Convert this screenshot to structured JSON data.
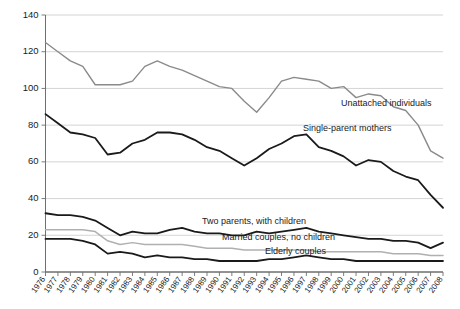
{
  "chart_data": {
    "type": "line",
    "title": "",
    "subtitle": "",
    "xlabel": "",
    "ylabel": "",
    "xlim": [
      1976,
      2008
    ],
    "ylim": [
      0,
      140
    ],
    "yticks": [
      0,
      20,
      40,
      60,
      80,
      100,
      120,
      140
    ],
    "grid": true,
    "legend_position": "inline-annotations",
    "categories": [
      1976,
      1977,
      1978,
      1979,
      1980,
      1981,
      1982,
      1983,
      1984,
      1985,
      1986,
      1987,
      1988,
      1989,
      1990,
      1991,
      1992,
      1993,
      1994,
      1995,
      1996,
      1997,
      1998,
      1999,
      2000,
      2001,
      2002,
      2003,
      2004,
      2005,
      2006,
      2007,
      2008
    ],
    "series": [
      {
        "name": "Unattached individuals",
        "color": "#8a8a8a",
        "width": 1.4,
        "label_x": 341,
        "label_y": 106,
        "values": [
          125,
          120,
          115,
          112,
          102,
          102,
          102,
          104,
          112,
          115,
          112,
          110,
          107,
          104,
          101,
          100,
          93,
          87,
          95,
          104,
          106,
          105,
          104,
          100,
          101,
          95,
          97,
          96,
          90,
          88,
          80,
          66,
          62
        ]
      },
      {
        "name": "Single-parent mothers",
        "color": "#1a1a1a",
        "width": 1.8,
        "label_x": 303,
        "label_y": 131,
        "values": [
          86,
          81,
          76,
          75,
          73,
          64,
          65,
          70,
          72,
          76,
          76,
          75,
          72,
          68,
          66,
          62,
          58,
          62,
          67,
          70,
          74,
          75,
          68,
          66,
          63,
          58,
          61,
          60,
          55,
          52,
          50,
          42,
          35
        ]
      },
      {
        "name": "Two parents, with children",
        "color": "#1a1a1a",
        "width": 1.8,
        "label_x": 202,
        "label_y": 224,
        "values": [
          32,
          31,
          31,
          30,
          28,
          24,
          20,
          22,
          21,
          21,
          23,
          24,
          22,
          21,
          21,
          20,
          20,
          22,
          21,
          22,
          23,
          24,
          22,
          21,
          20,
          19,
          18,
          18,
          17,
          17,
          16,
          13,
          16
        ]
      },
      {
        "name": "Married couples, no children",
        "color": "#1a1a1a",
        "width": 1.8,
        "label_x": 222,
        "label_y": 240,
        "values": [
          18,
          18,
          18,
          17,
          15,
          10,
          11,
          10,
          8,
          9,
          8,
          8,
          7,
          7,
          6,
          6,
          6,
          6,
          7,
          7,
          8,
          9,
          8,
          7,
          7,
          6,
          6,
          6,
          6,
          6,
          6,
          6,
          6
        ]
      },
      {
        "name": "Elderly couples",
        "color": "#b0b0b0",
        "width": 1.5,
        "label_x": 265,
        "label_y": 254,
        "values": [
          23,
          23,
          23,
          23,
          22,
          17,
          15,
          16,
          15,
          15,
          15,
          15,
          14,
          13,
          13,
          13,
          12,
          12,
          12,
          12,
          12,
          12,
          11,
          11,
          11,
          11,
          11,
          11,
          10,
          10,
          10,
          9,
          9
        ]
      }
    ]
  },
  "axis": {
    "y_tick_labels": [
      "0",
      "20",
      "40",
      "60",
      "80",
      "100",
      "120",
      "140"
    ],
    "x_tick_labels": [
      "1976",
      "1977",
      "1978",
      "1979",
      "1980",
      "1981",
      "1982",
      "1983",
      "1984",
      "1985",
      "1986",
      "1987",
      "1988",
      "1989",
      "1990",
      "1991",
      "1992",
      "1993",
      "1994",
      "1995",
      "1996",
      "1997",
      "1998",
      "1999",
      "2000",
      "2001",
      "2002",
      "2003",
      "2004",
      "2005",
      "2006",
      "2007",
      "2008"
    ]
  },
  "colors": {
    "grid": "#cfcfcf",
    "axis": "#6f6f6f",
    "dark_line": "#1a1a1a",
    "mid_gray_line": "#8a8a8a",
    "light_gray_line": "#b0b0b0",
    "text": "#1a1a1a",
    "background": "#ffffff"
  }
}
